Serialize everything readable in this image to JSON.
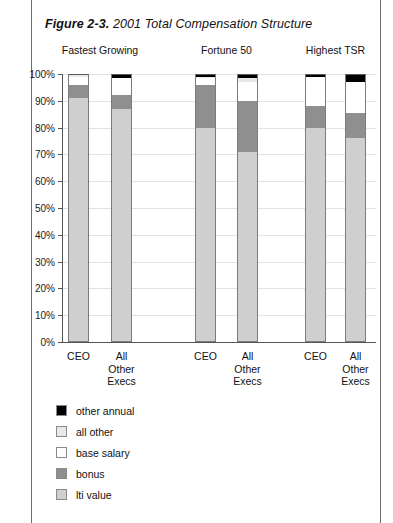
{
  "figure": {
    "number": "Figure 2-3.",
    "title": "2001 Total Compensation Structure"
  },
  "groups": [
    {
      "label": "Fastest Growing"
    },
    {
      "label": "Fortune 50"
    },
    {
      "label": "Highest TSR"
    }
  ],
  "x_labels": [
    "CEO",
    "All Other Execs",
    "CEO",
    "All Other Execs",
    "CEO",
    "All Other Execs"
  ],
  "legend": [
    {
      "label": "other annual",
      "color": "#000000"
    },
    {
      "label": "all other",
      "color": "#e8e8e8"
    },
    {
      "label": "base salary",
      "color": "#ffffff"
    },
    {
      "label": "bonus",
      "color": "#8f8f8f"
    },
    {
      "label": "lti value",
      "color": "#cfcfcf"
    }
  ],
  "chart_data": {
    "type": "bar",
    "title": "2001 Total Compensation Structure",
    "subtype": "stacked-vertical-100-percent",
    "xlabel": "",
    "ylabel": "",
    "ylim": [
      0,
      100
    ],
    "ytick_labels": [
      "0%",
      "10%",
      "20%",
      "30%",
      "40%",
      "50%",
      "60%",
      "70%",
      "80%",
      "90%",
      "100%"
    ],
    "yticks": [
      0,
      10,
      20,
      30,
      40,
      50,
      60,
      70,
      80,
      90,
      100
    ],
    "grid": true,
    "legend_position": "below-left",
    "group_labels": [
      "Fastest Growing",
      "Fortune 50",
      "Highest TSR"
    ],
    "categories": [
      "Fastest Growing / CEO",
      "Fastest Growing / All Other Execs",
      "Fortune 50 / CEO",
      "Fortune 50 / All Other Execs",
      "Highest TSR / CEO",
      "Highest TSR / All Other Execs"
    ],
    "series": [
      {
        "name": "lti value",
        "color": "#cfcfcf",
        "values": [
          91,
          87,
          80,
          71,
          80,
          76
        ]
      },
      {
        "name": "bonus",
        "color": "#8f8f8f",
        "values": [
          5,
          5,
          16,
          19,
          8,
          9.5
        ]
      },
      {
        "name": "base salary",
        "color": "#ffffff",
        "values": [
          3,
          6.5,
          2.5,
          7,
          11,
          11.5
        ]
      },
      {
        "name": "all other",
        "color": "#e8e8e8",
        "values": [
          0.5,
          0,
          0.5,
          1.5,
          0,
          0
        ]
      },
      {
        "name": "other annual",
        "color": "#000000",
        "values": [
          0.5,
          1.5,
          1,
          1.5,
          1,
          3
        ]
      }
    ],
    "units": "percent of total compensation"
  }
}
